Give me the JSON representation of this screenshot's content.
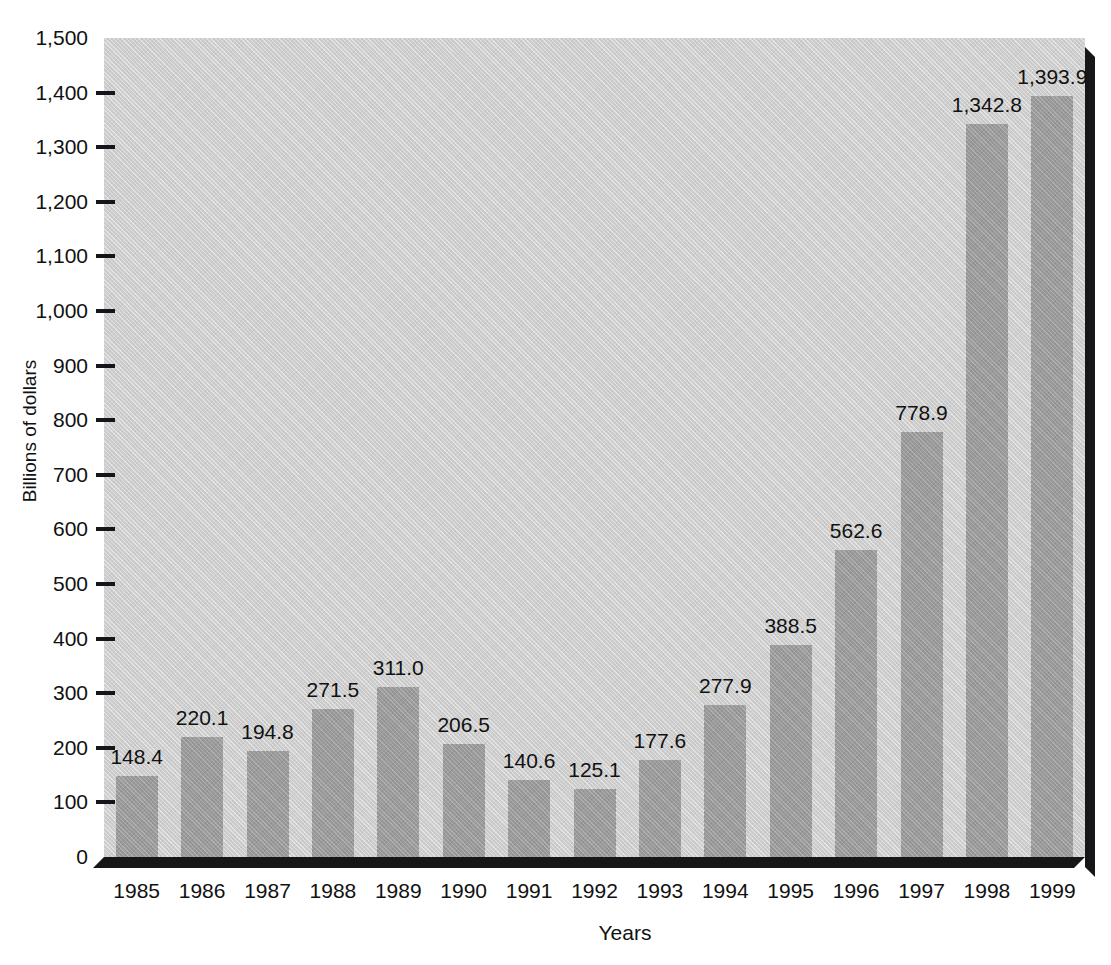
{
  "chart_data": {
    "type": "bar",
    "title": "",
    "xlabel": "Years",
    "ylabel": "Billions of dollars",
    "categories": [
      "1985",
      "1986",
      "1987",
      "1988",
      "1989",
      "1990",
      "1991",
      "1992",
      "1993",
      "1994",
      "1995",
      "1996",
      "1997",
      "1998",
      "1999"
    ],
    "values": [
      148.4,
      220.1,
      194.8,
      271.5,
      311.0,
      206.5,
      140.6,
      125.1,
      177.6,
      277.9,
      388.5,
      562.6,
      778.9,
      1342.8,
      1393.9
    ],
    "value_labels": [
      "148.4",
      "220.1",
      "194.8",
      "271.5",
      "311.0",
      "206.5",
      "140.6",
      "125.1",
      "177.6",
      "277.9",
      "388.5",
      "562.6",
      "778.9",
      "1,342.8",
      "1,393.9"
    ],
    "ylim": [
      0,
      1500
    ],
    "ytick_values": [
      0,
      100,
      200,
      300,
      400,
      500,
      600,
      700,
      800,
      900,
      1000,
      1100,
      1200,
      1300,
      1400,
      1500
    ],
    "ytick_labels": [
      "0",
      "100",
      "200",
      "300",
      "400",
      "500",
      "600",
      "700",
      "800",
      "900",
      "1,000",
      "1,100",
      "1,200",
      "1,300",
      "1,400",
      "1,500"
    ],
    "grid": false,
    "legend": null,
    "colors": {
      "bar_fill": "#9a9a9a",
      "plot_background": "#cdcdcd",
      "page_background": "#ffffff",
      "axis_shadow": "#17171a",
      "text": "#111111"
    }
  }
}
